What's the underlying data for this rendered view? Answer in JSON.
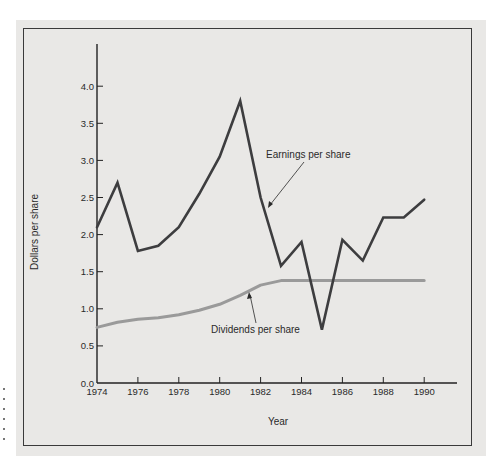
{
  "chart_data": {
    "type": "line",
    "title": "",
    "xlabel": "Year",
    "ylabel": "Dollars per share",
    "x": [
      1974,
      1975,
      1976,
      1977,
      1978,
      1979,
      1980,
      1981,
      1982,
      1983,
      1984,
      1985,
      1986,
      1987,
      1988,
      1989,
      1990
    ],
    "series": [
      {
        "name": "Earnings per share",
        "color": "#3d3d3f",
        "values": [
          2.1,
          2.7,
          1.78,
          1.85,
          2.1,
          2.55,
          3.05,
          3.8,
          2.5,
          1.58,
          1.9,
          0.72,
          1.93,
          1.65,
          2.23,
          2.23,
          2.47
        ]
      },
      {
        "name": "Dividends per share",
        "color": "#9a9a9a",
        "values": [
          0.75,
          0.82,
          0.86,
          0.88,
          0.92,
          0.98,
          1.06,
          1.18,
          1.32,
          1.38,
          1.38,
          1.38,
          1.38,
          1.38,
          1.38,
          1.38,
          1.38
        ]
      }
    ],
    "x_ticks": [
      "1974",
      "1976",
      "1978",
      "1980",
      "1982",
      "1984",
      "1986",
      "1988",
      "1990"
    ],
    "y_ticks": [
      "0.0",
      "0.5",
      "1.0",
      "1.5",
      "2.0",
      "2.5",
      "3.0",
      "3.5",
      "4.0"
    ],
    "xlim": [
      1974,
      1991.6
    ],
    "ylim": [
      0,
      4.5
    ],
    "grid": false,
    "legend": "none (inline annotations with arrows)",
    "annotations": [
      {
        "text": "Earnings per share",
        "points_to": "Earnings per share line near 1982"
      },
      {
        "text": "Dividends per share",
        "points_to": "Dividends per share line near 1981"
      }
    ]
  },
  "labels": {
    "xlabel": "Year",
    "ylabel": "Dollars per share",
    "earnings_annotation": "Earnings per share",
    "dividends_annotation": "Dividends per share"
  }
}
